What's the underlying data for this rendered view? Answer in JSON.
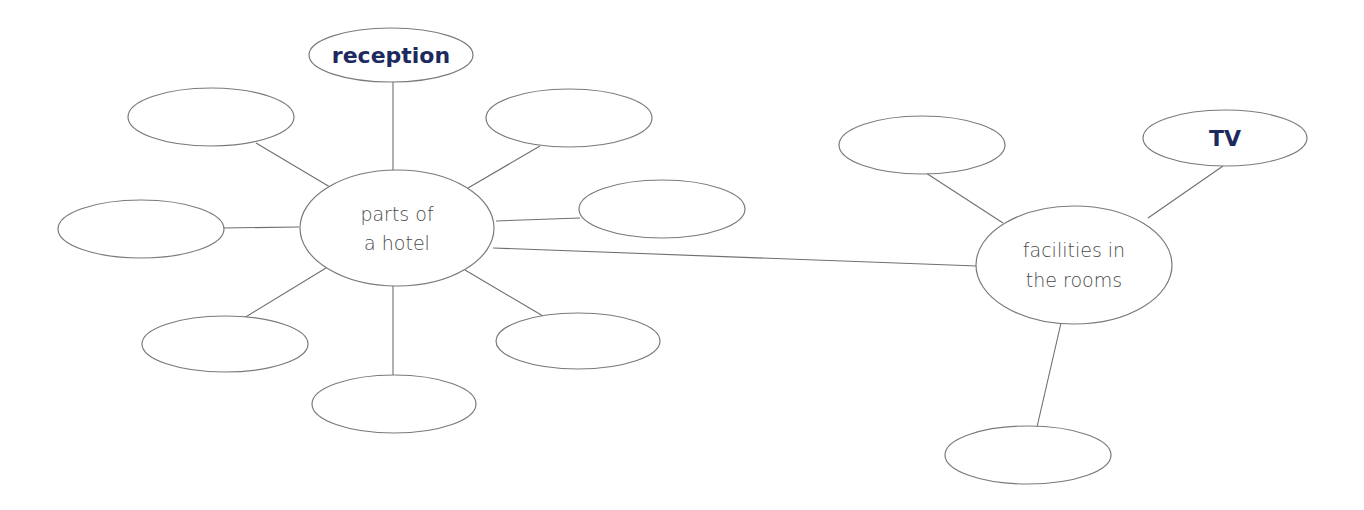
{
  "diagram": {
    "colors": {
      "answer_text": "#1d2a5e",
      "hub_text": "#4a4a4a",
      "outline": "#7a7a7a"
    },
    "hubs": {
      "parts_of_hotel": {
        "lines": [
          "parts of",
          "a hotel"
        ]
      },
      "facilities": {
        "lines": [
          "facilities in",
          "the rooms"
        ]
      }
    },
    "parts_of_hotel_branches": [
      {
        "id": "top",
        "text": "reception"
      },
      {
        "id": "top-left",
        "text": ""
      },
      {
        "id": "top-right",
        "text": ""
      },
      {
        "id": "right",
        "text": ""
      },
      {
        "id": "left",
        "text": ""
      },
      {
        "id": "bottom-left",
        "text": ""
      },
      {
        "id": "bottom-right",
        "text": ""
      },
      {
        "id": "bottom",
        "text": ""
      }
    ],
    "facilities_branches": [
      {
        "id": "top-left",
        "text": ""
      },
      {
        "id": "top-right",
        "text": "TV"
      },
      {
        "id": "bottom",
        "text": ""
      }
    ]
  }
}
